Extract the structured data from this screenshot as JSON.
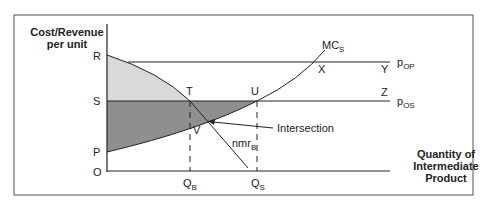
{
  "diagram": {
    "y_axis_label_line1": "Cost/Revenue",
    "y_axis_label_line2": "per unit",
    "x_axis_label_line1": "Quantity of",
    "x_axis_label_line2": "Intermediate",
    "x_axis_label_line3": "Product",
    "points": {
      "R": "R",
      "S": "S",
      "P": "P",
      "O": "O",
      "T": "T",
      "U": "U",
      "V": "V",
      "X": "X",
      "Y": "Y",
      "Z": "Z"
    },
    "curves": {
      "mc_main": "MC",
      "mc_sub": "S",
      "nmr_main": "nmr",
      "nmr_sub": "B"
    },
    "prices": {
      "pop_main": "p",
      "pop_sub": "OP",
      "pos_main": "p",
      "pos_sub": "OS"
    },
    "quantities": {
      "qb_main": "Q",
      "qb_sub": "B",
      "qs_main": "Q",
      "qs_sub": "S"
    },
    "annotation": "Intersection",
    "colors": {
      "light_shade": "#d9d9d9",
      "dark_shade": "#8f8f8f",
      "line": "#222222",
      "frame": "#555555"
    }
  }
}
